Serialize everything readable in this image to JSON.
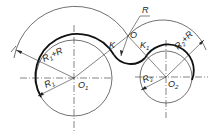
{
  "diagram": {
    "type": "arc-tangent-construction",
    "labels": {
      "R": "R",
      "O": "O",
      "K": "K",
      "K1_main": "K",
      "K1_sub": "1",
      "R1_plus_R_main": "R",
      "R1_plus_R_sub": "1",
      "R1_plus_R_rest": "+R",
      "R2_plus_R_main": "R",
      "R2_plus_R_sub": "2",
      "R2_plus_R_rest": "+R",
      "R1_main": "R",
      "R1_sub": "1",
      "R2_main": "R",
      "R2_sub": "2",
      "O1_main": "O",
      "O1_sub": "1",
      "O2_main": "O",
      "O2_sub": "2"
    },
    "colors": {
      "line": "#222222",
      "background": "#ffffff"
    }
  }
}
